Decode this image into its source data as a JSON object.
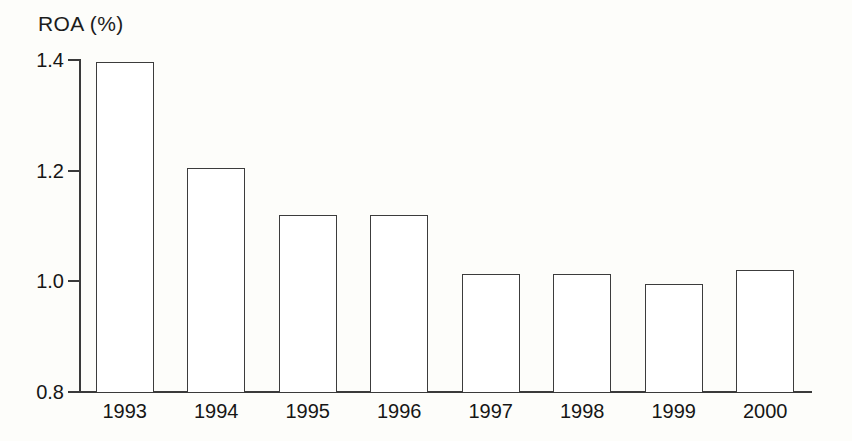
{
  "chart_data": {
    "type": "bar",
    "title": "ROA (%)",
    "xlabel": "",
    "ylabel": "ROA (%)",
    "categories": [
      "1993",
      "1994",
      "1995",
      "1996",
      "1997",
      "1998",
      "1999",
      "2000"
    ],
    "values": [
      1.397,
      1.205,
      1.12,
      1.12,
      1.013,
      1.013,
      0.995,
      1.02
    ],
    "series": [
      {
        "name": "ROA (%)",
        "values": [
          1.397,
          1.205,
          1.12,
          1.12,
          1.013,
          1.013,
          0.995,
          1.02
        ]
      }
    ],
    "ylim": [
      0.8,
      1.4
    ],
    "yticks": [
      "1.4",
      "1.2",
      "1.0",
      "0.8"
    ],
    "ytick_values": [
      1.4,
      1.2,
      1.0,
      0.8
    ],
    "grid": false,
    "legend": null,
    "legend_position": "none",
    "bar_fill": "#ffffff",
    "bar_edge_color": "#3c3c3c",
    "axis_color": "#3a3a3a",
    "background_color": "#fdfdfa",
    "text_color": "#161616"
  }
}
